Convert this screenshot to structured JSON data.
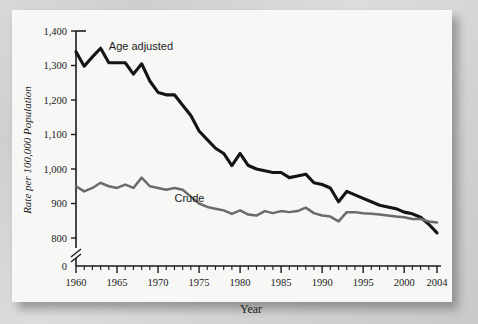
{
  "figure": {
    "background_color": "#d4d4d4",
    "plate_color": "#f7f7f5",
    "axis_color": "#1a1a1a"
  },
  "chart_data": {
    "type": "line",
    "title": "",
    "xlabel": "Year",
    "ylabel": "Rate per 100,000 Population",
    "xlim": [
      1960,
      2004
    ],
    "ylim": [
      800,
      1400
    ],
    "y_axis_break": true,
    "y_break_labels": [
      "0",
      "800"
    ],
    "grid": false,
    "legend_position": "inline-annotation",
    "ytick_labels": [
      "1,400",
      "1,300",
      "1,200",
      "1,100",
      "1,000",
      "900",
      "800",
      "0"
    ],
    "ytick_values": [
      1400,
      1300,
      1200,
      1100,
      1000,
      900,
      800,
      0
    ],
    "xtick_labels": [
      "1960",
      "1965",
      "1970",
      "1975",
      "1980",
      "1985",
      "1990",
      "1995",
      "2000",
      "2004"
    ],
    "xtick_values": [
      1960,
      1965,
      1970,
      1975,
      1980,
      1985,
      1990,
      1995,
      2000,
      2004
    ],
    "x": [
      1960,
      1961,
      1962,
      1963,
      1964,
      1965,
      1966,
      1967,
      1968,
      1969,
      1970,
      1971,
      1972,
      1973,
      1974,
      1975,
      1976,
      1977,
      1978,
      1979,
      1980,
      1981,
      1982,
      1983,
      1984,
      1985,
      1986,
      1987,
      1988,
      1989,
      1990,
      1991,
      1992,
      1993,
      1994,
      1995,
      1996,
      1997,
      1998,
      1999,
      2000,
      2001,
      2002,
      2003,
      2004
    ],
    "series": [
      {
        "name": "Age adjusted",
        "color": "#141414",
        "label_x": 1964,
        "label_y": 1345,
        "values": [
          1340,
          1298,
          1325,
          1350,
          1308,
          1308,
          1308,
          1275,
          1305,
          1255,
          1222,
          1215,
          1215,
          1185,
          1155,
          1110,
          1085,
          1060,
          1045,
          1010,
          1045,
          1010,
          1000,
          995,
          990,
          990,
          975,
          980,
          985,
          960,
          955,
          945,
          905,
          935,
          925,
          915,
          905,
          895,
          890,
          885,
          875,
          870,
          860,
          840,
          815
        ]
      },
      {
        "name": "Crude",
        "color": "#6b6b6b",
        "label_x": 1972,
        "label_y": 905,
        "values": [
          950,
          935,
          945,
          960,
          950,
          945,
          955,
          945,
          975,
          950,
          945,
          940,
          945,
          940,
          920,
          900,
          890,
          885,
          880,
          870,
          880,
          868,
          865,
          878,
          872,
          878,
          875,
          878,
          888,
          872,
          865,
          862,
          848,
          875,
          875,
          872,
          870,
          868,
          865,
          862,
          860,
          855,
          855,
          848,
          845
        ]
      }
    ]
  }
}
